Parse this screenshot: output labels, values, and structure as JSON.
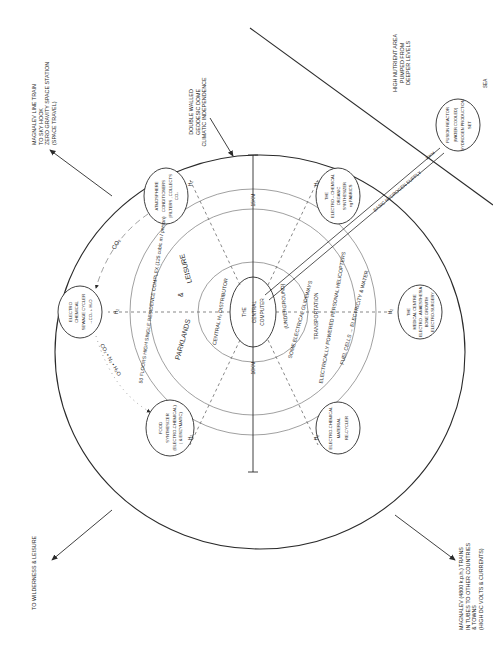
{
  "diagram": {
    "orientation": "rotated 90deg counter-clockwise (text reads bottom-to-top)",
    "colors": {
      "line": "#2a2a2a",
      "dash": "#555555",
      "background": "#ffffff"
    },
    "external_labels": {
      "maglev_sky_hook": [
        "MAGNALEV LINE TRAIN",
        "TO SKY HOOK",
        "ZERO GRAVITY SPACE STATION",
        "(SPACE TRAVEL)"
      ],
      "dome": [
        "DOUBLE WALLED",
        "GEODESIC DOME",
        "CLIMATIC INDEPENDENCE"
      ],
      "nutrient": [
        "HIGH NUTRIENT AREA",
        "PUMPED FROM",
        "DEEPER    LEVELS"
      ],
      "sea": "SEA",
      "wilderness": "TO WILDERNESS & LEISURE",
      "maglev_trains": [
        "MAGNALEV (4800 k.p.h.) TRAINS",
        "IN TUBES TO OTHER COUNTRIES",
        "& TOWNS",
        "(HIGH DC VOLTS & CURRENTS)"
      ]
    },
    "dimensions": {
      "outer": "15KM",
      "inner": "10KM",
      "pipe": "30KM"
    },
    "pipe_label": "BASIC  HYDROGEN  SUPPLY",
    "center": {
      "line1": "THE",
      "line2": "CENTRAL",
      "line3": "COMPUTER"
    },
    "rings": {
      "distributor": "CENTRAL H₂ DISTRIBUTOR",
      "underground": "(UNDERGROUND)",
      "glideways": "SOME ELECTRICAL GLIDEWAYS",
      "transportation": "TRANSPORTATION",
      "helicopters": "ELECTRICALLY POWERED PERSONAL HELICOPTERS",
      "fuel_cells": "FUEL CELLS → ELECTRICITY & WATER",
      "parklands": "PARKLANDS",
      "amp": "&",
      "leisure": "LEISURE",
      "residence": "50 FLOORS HIGH SINGLE RESIDENCE COMPLEX (125 cubic m / person)"
    },
    "nodes": {
      "atmosphere": [
        "ATMOSPHERE",
        "CONDITIONERS",
        "(FILTERS , COLLECTS",
        "CO₂"
      ],
      "sewage": [
        "ELECTRO",
        "CHEMICAL",
        "SEWAGE CYCLER",
        "→CO₂ + H₂O"
      ],
      "food": [
        "FOOD",
        "SYNTHESIZER",
        "(ELECTRO-CHEMICAL)",
        "( & ENZYMATIC)"
      ],
      "material": [
        "ELECTRO-CHEMICAL",
        "MATERIAL",
        "RE-CYCLER"
      ],
      "medical": [
        "THE",
        "MEDICAL CENTRE",
        "ELECTRO - ANAESTHESIA",
        "BONE GROWTH",
        "ELECTRO-SURGERY"
      ],
      "organic": [
        "THE",
        "ELECTRO – CHEMICAL",
        "ORGANIC",
        "SYNTHESIZER",
        "eg FABRICS"
      ],
      "fusion": [
        "FUSION REACTOR",
        "(WATER COOLED)",
        "HYDROGEN PRODUCTION",
        "SET"
      ]
    },
    "flows": {
      "h2": "H₂",
      "co2_top": "CO₂",
      "bottom_chain": "CO₂  •  N₂  •  H₂O"
    }
  }
}
